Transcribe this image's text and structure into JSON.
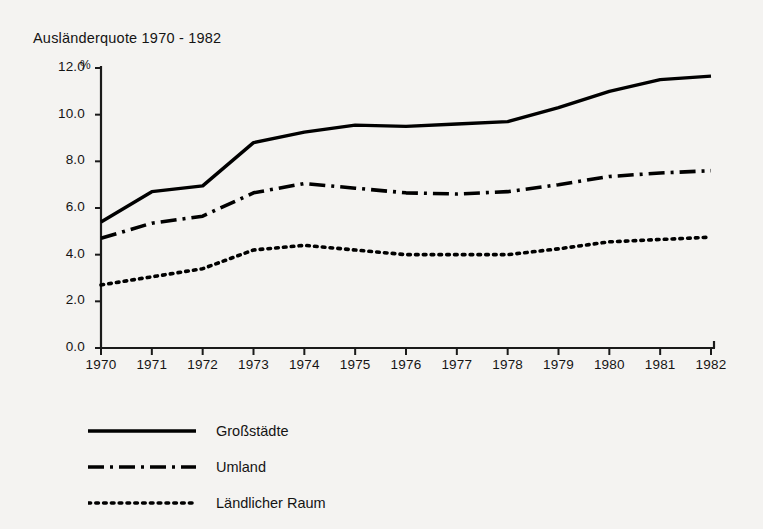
{
  "chart_data": {
    "type": "line",
    "title": "Ausländerquote 1970 - 1982",
    "xlabel": "",
    "ylabel": "%",
    "unit_symbol": "%",
    "categories": [
      "1970",
      "1971",
      "1972",
      "1973",
      "1974",
      "1975",
      "1976",
      "1977",
      "1978",
      "1979",
      "1980",
      "1981",
      "1982"
    ],
    "x": [
      1970,
      1971,
      1972,
      1973,
      1974,
      1975,
      1976,
      1977,
      1978,
      1979,
      1980,
      1981,
      1982
    ],
    "xlim": [
      1970,
      1982
    ],
    "ylim": [
      0.0,
      12.0
    ],
    "yticks": [
      0.0,
      2.0,
      4.0,
      6.0,
      8.0,
      10.0,
      12.0
    ],
    "ytick_labels": [
      "0.0",
      "2.0",
      "4.0",
      "6.0",
      "8.0",
      "10.0",
      "12.0"
    ],
    "grid": false,
    "legend_position": "below-left",
    "series": [
      {
        "name": "Großstädte",
        "style": "solid",
        "color": "#000000",
        "values": [
          5.4,
          6.7,
          6.95,
          8.8,
          9.25,
          9.55,
          9.5,
          9.6,
          9.7,
          10.3,
          11.0,
          11.5,
          11.65
        ]
      },
      {
        "name": "Umland",
        "style": "dash-dot",
        "color": "#000000",
        "values": [
          4.7,
          5.35,
          5.65,
          6.65,
          7.05,
          6.85,
          6.65,
          6.6,
          6.7,
          7.0,
          7.35,
          7.5,
          7.6
        ]
      },
      {
        "name": "Ländlicher Raum",
        "style": "dotted",
        "color": "#000000",
        "values": [
          2.7,
          3.05,
          3.4,
          4.2,
          4.4,
          4.2,
          4.0,
          4.0,
          4.0,
          4.25,
          4.55,
          4.65,
          4.75
        ]
      }
    ]
  },
  "legend": {
    "items": [
      {
        "label": "Großstädte",
        "style": "solid"
      },
      {
        "label": "Umland",
        "style": "dash-dot"
      },
      {
        "label": "Ländlicher Raum",
        "style": "dotted"
      }
    ]
  }
}
